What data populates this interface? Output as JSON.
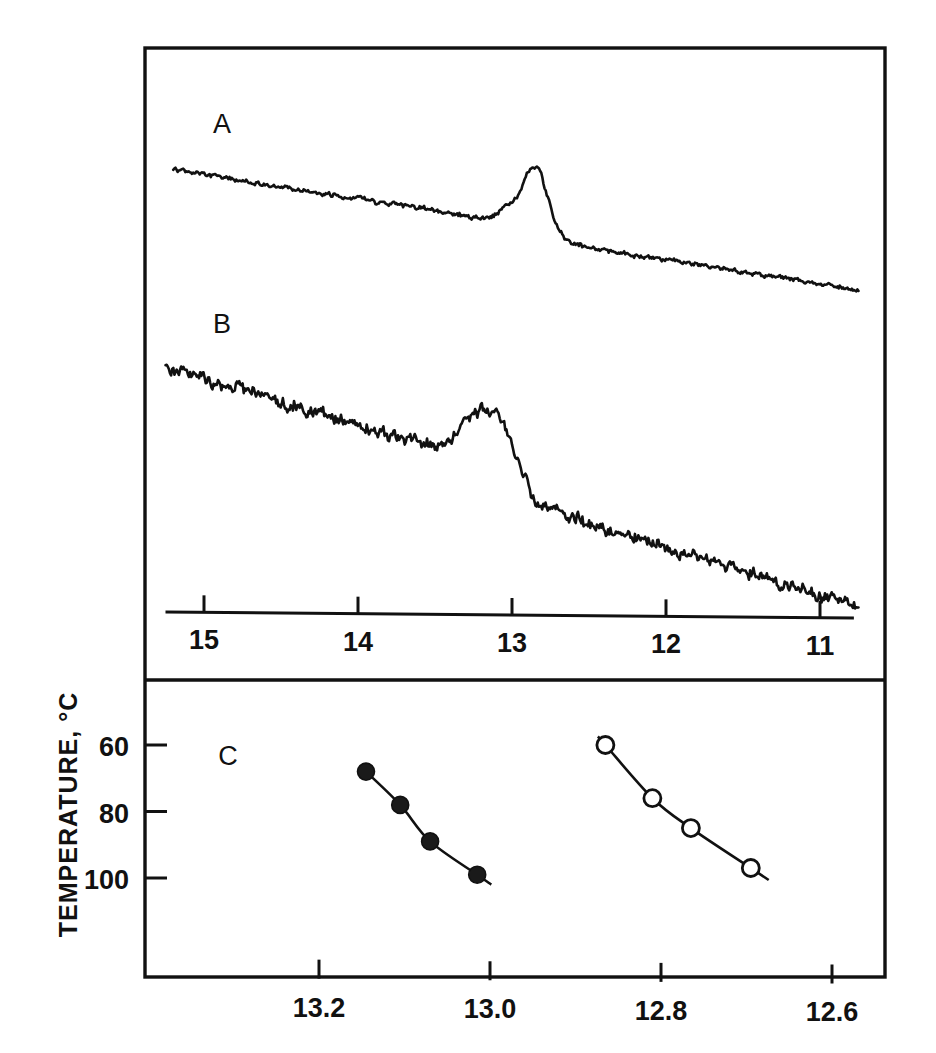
{
  "figure": {
    "ylabel": "TEMPERATURE, °C",
    "panels": [
      {
        "label": "A",
        "label_x": 222,
        "label_y": 133
      },
      {
        "label": "B",
        "label_x": 222,
        "label_y": 333
      },
      {
        "label": "C",
        "label_x": 228,
        "label_y": 765
      }
    ]
  },
  "chart_data": [
    {
      "type": "line",
      "name": "spectrum-A",
      "title": "A",
      "xlabel": "",
      "ylabel": "",
      "xlim": [
        15.35,
        10.65
      ],
      "grid": false,
      "legend": null,
      "xticks": [
        15,
        14,
        13,
        12,
        11
      ],
      "xticklabels": [
        "15",
        "14",
        "13",
        "12",
        "11"
      ],
      "annotation": "sharp resonance near 12.85 ppm on a smoothly descending baseline",
      "baseline": {
        "x_start": 15.2,
        "y_start": 170,
        "x_end": 10.75,
        "y_end": 277
      },
      "noise_amp": 3.2,
      "peak": {
        "center": 12.85,
        "height": 62,
        "width": 0.11
      },
      "shoulder": {
        "center": 13.03,
        "height": 13,
        "width": 0.09
      },
      "step": {
        "center": 12.72,
        "drop": 13,
        "width": 0.06
      }
    },
    {
      "type": "line",
      "name": "spectrum-B",
      "title": "B",
      "xlabel": "",
      "ylabel": "",
      "xlim": [
        15.35,
        10.65
      ],
      "grid": false,
      "legend": null,
      "xticks": [
        15,
        14,
        13,
        12,
        11
      ],
      "xticklabels": [
        "15",
        "14",
        "13",
        "12",
        "11"
      ],
      "annotation": "broad noisy resonance near 13.10 ppm with sharp drop near 12.95 ppm",
      "baseline": {
        "x_start": 15.25,
        "y_start": 366,
        "x_end": 10.75,
        "y_end": 578
      },
      "noise_amp": 9.0,
      "peak": {
        "center": 13.12,
        "height": 56,
        "width": 0.18
      },
      "shoulder": {
        "center": 13.32,
        "height": 16,
        "width": 0.12
      },
      "step": {
        "center": 12.95,
        "drop": 28,
        "width": 0.05
      }
    },
    {
      "type": "scatter",
      "name": "melting-curves",
      "title": "C",
      "xlabel": "",
      "ylabel": "TEMPERATURE, °C",
      "xlim": [
        13.32,
        12.55
      ],
      "ylim": [
        100,
        55
      ],
      "y_inverted": true,
      "grid": false,
      "xticks": [
        13.2,
        13.0,
        12.8,
        12.6
      ],
      "xticklabels": [
        "13.2",
        "13.0",
        "12.8",
        "12.6"
      ],
      "yticks": [
        60,
        80,
        100
      ],
      "yticklabels": [
        "60",
        "80",
        "100"
      ],
      "series": [
        {
          "name": "filled-circles",
          "marker": "filled-circle",
          "points": [
            {
              "x": 13.145,
              "y": 68
            },
            {
              "x": 13.105,
              "y": 78
            },
            {
              "x": 13.07,
              "y": 89
            },
            {
              "x": 13.015,
              "y": 99
            }
          ]
        },
        {
          "name": "open-circles",
          "marker": "open-circle",
          "points": [
            {
              "x": 12.865,
              "y": 60
            },
            {
              "x": 12.81,
              "y": 76
            },
            {
              "x": 12.765,
              "y": 85
            },
            {
              "x": 12.695,
              "y": 97
            }
          ]
        }
      ]
    }
  ],
  "colors": {
    "ink": "#111111",
    "background": "#ffffff",
    "marker_fill": "#1a1a1a",
    "marker_open": "#ffffff"
  }
}
